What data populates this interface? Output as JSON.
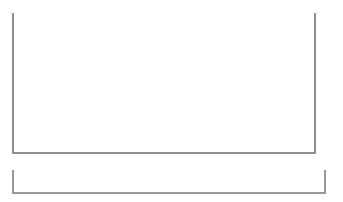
{
  "chart": {
    "title": "",
    "y_axis": {
      "labels": [
        "400",
        "350",
        "300",
        "250",
        "200",
        "150",
        "100",
        "50"
      ],
      "min": 50,
      "max": 400
    },
    "x_axis": {
      "labels": [
        "1995",
        "2000",
        "2005",
        "2010",
        "2015",
        "2020"
      ],
      "values": [
        1995,
        2000,
        2005,
        2010,
        2015,
        2020
      ],
      "min": 1991,
      "max": 2023
    },
    "colors": {
      "area_fill": "#c9c9c9",
      "axis": "#8f8f8f",
      "tick_text": "#6d6d6d",
      "gridline": "#f4f4f4",
      "navigator_fill": "#b6b6b6",
      "navigator_handle": "#9a9a9a"
    }
  },
  "navigator": {
    "x_labels": [
      "2000",
      "2010",
      "2020"
    ],
    "x_values": [
      2000,
      2010,
      2020
    ],
    "range_start": 1991,
    "range_end": 2023
  },
  "chart_data": {
    "type": "area",
    "title": "",
    "xlabel": "",
    "ylabel": "",
    "ylim": [
      50,
      400
    ],
    "xlim": [
      1991,
      2023
    ],
    "grid": true,
    "legend": "none",
    "x": [
      1991,
      1991.5,
      1992,
      1992.5,
      1993,
      1993.5,
      1994,
      1994.5,
      1995,
      1995.5,
      1996,
      1996.5,
      1997,
      1997.5,
      1998,
      1998.5,
      1999,
      1999.5,
      2000,
      2000.5,
      2001,
      2001.5,
      2002,
      2002.5,
      2003,
      2003.5,
      2004,
      2004.5,
      2005,
      2005.5,
      2006,
      2006.5,
      2007,
      2007.5,
      2008,
      2008.5,
      2009,
      2009.5,
      2010,
      2010.5,
      2011,
      2011.5,
      2012,
      2012.5,
      2013,
      2013.5,
      2014,
      2014.5,
      2015,
      2015.5,
      2016,
      2016.5,
      2017,
      2017.5,
      2018,
      2018.5,
      2019,
      2019.5,
      2020,
      2020.5,
      2021,
      2021.5,
      2022,
      2022.5,
      2023
    ],
    "values": [
      97,
      98,
      100,
      101,
      103,
      105,
      107,
      109,
      112,
      114,
      117,
      119,
      122,
      125,
      128,
      131,
      134,
      137,
      140,
      143,
      146,
      149,
      152,
      156,
      161,
      166,
      172,
      178,
      185,
      193,
      202,
      212,
      219,
      222,
      220,
      213,
      205,
      200,
      197,
      196,
      192,
      186,
      179,
      178,
      181,
      186,
      192,
      197,
      203,
      209,
      215,
      221,
      228,
      236,
      244,
      252,
      260,
      268,
      277,
      286,
      296,
      304,
      312,
      352,
      395
    ],
    "series": [
      {
        "name": "Index",
        "values": [
          97,
          98,
          100,
          101,
          103,
          105,
          107,
          109,
          112,
          114,
          117,
          119,
          122,
          125,
          128,
          131,
          134,
          137,
          140,
          143,
          146,
          149,
          152,
          156,
          161,
          166,
          172,
          178,
          185,
          193,
          202,
          212,
          219,
          222,
          220,
          213,
          205,
          200,
          197,
          196,
          192,
          186,
          179,
          178,
          181,
          186,
          192,
          197,
          203,
          209,
          215,
          221,
          228,
          236,
          244,
          252,
          260,
          268,
          277,
          286,
          296,
          304,
          312,
          352,
          395
        ]
      }
    ],
    "annotations": {
      "peak_2007": 222,
      "trough_2012": 178,
      "start_1991": 97,
      "end_2023": 395
    }
  }
}
